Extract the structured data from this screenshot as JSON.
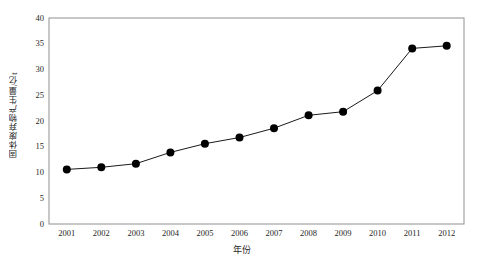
{
  "chart_data": {
    "type": "line",
    "title": "",
    "subtitle": "",
    "xlabel": "年份",
    "ylabel": "固体废弃物产生量/亿t",
    "categories": [
      "2001",
      "2002",
      "2003",
      "2004",
      "2005",
      "2006",
      "2007",
      "2008",
      "2009",
      "2010",
      "2011",
      "2012"
    ],
    "x": [
      2001,
      2002,
      2003,
      2004,
      2005,
      2006,
      2007,
      2008,
      2009,
      2010,
      2011,
      2012
    ],
    "values": [
      10.6,
      11.0,
      11.7,
      13.9,
      15.6,
      16.8,
      18.6,
      21.1,
      21.8,
      25.9,
      34.1,
      34.6
    ],
    "series": [
      {
        "name": "固体废弃物产生量",
        "values": [
          10.6,
          11.0,
          11.7,
          13.9,
          15.6,
          16.8,
          18.6,
          21.1,
          21.8,
          25.9,
          34.1,
          34.6
        ],
        "color": "#000000",
        "marker": "filled-circle"
      }
    ],
    "ylim": [
      0,
      40
    ],
    "yticks": [
      0,
      5,
      10,
      15,
      20,
      25,
      30,
      35,
      40
    ],
    "ytick_labels": [
      "0",
      "5",
      "10",
      "15",
      "20",
      "25",
      "30",
      "35",
      "40"
    ],
    "xtick_labels": [
      "2001",
      "2002",
      "2003",
      "2004",
      "2005",
      "2006",
      "2007",
      "2008",
      "2009",
      "2010",
      "2011",
      "2012"
    ],
    "grid": false,
    "legend": null,
    "legend_position": "none",
    "plot_border_color": "#808080",
    "background_color": "#ffffff",
    "annotations": []
  },
  "axes": {
    "y_title": "固体废弃物产生量/亿t",
    "x_title": "年份"
  },
  "ticks": {
    "y": {
      "t0": "0",
      "t1": "5",
      "t2": "10",
      "t3": "15",
      "t4": "20",
      "t5": "25",
      "t6": "30",
      "t7": "35",
      "t8": "40"
    },
    "x": {
      "t0": "2001",
      "t1": "2002",
      "t2": "2003",
      "t3": "2004",
      "t4": "2005",
      "t5": "2006",
      "t6": "2007",
      "t7": "2008",
      "t8": "2009",
      "t9": "2010",
      "t10": "2011",
      "t11": "2012"
    }
  }
}
